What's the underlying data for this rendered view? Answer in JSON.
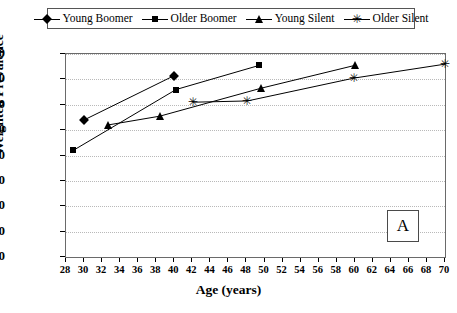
{
  "chart_data": {
    "type": "line",
    "title": "",
    "panel_label": "A",
    "xlabel": "Age (years)",
    "ylabel": "Weighted Prevalence",
    "xlim": [
      28,
      70
    ],
    "ylim": [
      0,
      80
    ],
    "xticks": [
      28,
      30,
      32,
      34,
      36,
      38,
      40,
      42,
      44,
      46,
      48,
      50,
      52,
      54,
      56,
      58,
      60,
      62,
      64,
      66,
      68,
      70
    ],
    "yticks": [
      0,
      10,
      20,
      30,
      40,
      50,
      60,
      70,
      80
    ],
    "grid": "horizontal-dotted",
    "legend_position": "top",
    "series": [
      {
        "name": "Young Boomer",
        "marker": "diamond",
        "points": [
          {
            "x": 30,
            "y": 54
          },
          {
            "x": 40,
            "y": 71.5
          }
        ]
      },
      {
        "name": "Older Boomer",
        "marker": "square",
        "points": [
          {
            "x": 28.8,
            "y": 42
          },
          {
            "x": 40.2,
            "y": 66
          },
          {
            "x": 49.4,
            "y": 75.5
          }
        ]
      },
      {
        "name": "Young Silent",
        "marker": "triangle",
        "points": [
          {
            "x": 32.6,
            "y": 52
          },
          {
            "x": 38.4,
            "y": 55.5
          },
          {
            "x": 49.6,
            "y": 66.5
          },
          {
            "x": 60,
            "y": 75.5
          }
        ]
      },
      {
        "name": "Older Silent",
        "marker": "star",
        "points": [
          {
            "x": 42.1,
            "y": 61
          },
          {
            "x": 48.1,
            "y": 61.5
          },
          {
            "x": 59.9,
            "y": 70.5
          },
          {
            "x": 70,
            "y": 76
          }
        ]
      }
    ]
  },
  "legend": {
    "entries": [
      {
        "label": "Young Boomer",
        "marker": "diamond"
      },
      {
        "label": "Older Boomer",
        "marker": "square"
      },
      {
        "label": "Young Silent",
        "marker": "triangle"
      },
      {
        "label": "Older Silent",
        "marker": "star"
      }
    ]
  },
  "colors": {
    "series_line": "#000000",
    "marker": "#000000",
    "gridline": "#b9b9b9",
    "axis": "#000000",
    "frame": "#6a6a6a",
    "background": "#ffffff"
  }
}
